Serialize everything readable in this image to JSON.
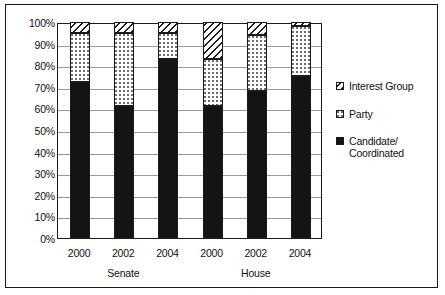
{
  "chart_data": {
    "type": "bar",
    "subtype": "stacked-100-percent",
    "title": "",
    "xlabel": "",
    "ylabel": "",
    "ylim": [
      0,
      100
    ],
    "y_tick_labels": [
      "100%",
      "90%",
      "80%",
      "70%",
      "60%",
      "50%",
      "40%",
      "30%",
      "20%",
      "10%",
      "0%"
    ],
    "y_tick_values": [
      100,
      90,
      80,
      70,
      60,
      50,
      40,
      30,
      20,
      10,
      0
    ],
    "grid": true,
    "legend_position": "right",
    "categories": [
      "2000",
      "2002",
      "2004",
      "2000",
      "2002",
      "2004"
    ],
    "groups": [
      {
        "name": "Senate",
        "categories": [
          "2000",
          "2002",
          "2004"
        ]
      },
      {
        "name": "House",
        "categories": [
          "2000",
          "2002",
          "2004"
        ]
      }
    ],
    "series": [
      {
        "name": "Candidate/\nCoordinated",
        "pattern": "solid-black",
        "values": [
          72,
          61,
          83,
          61,
          68,
          75
        ]
      },
      {
        "name": "Party",
        "pattern": "dotted",
        "values": [
          23,
          34,
          12,
          22,
          26,
          23
        ]
      },
      {
        "name": "Interest Group",
        "pattern": "diagonal-hatch",
        "values": [
          5,
          5,
          5,
          17,
          6,
          2
        ]
      }
    ]
  },
  "legend": {
    "items": [
      {
        "label": "Interest Group",
        "swatch": "diagonal-hatch-icon"
      },
      {
        "label": "Party",
        "swatch": "dotted-icon"
      },
      {
        "label": "Candidate/\nCoordinated",
        "swatch": "solid-black-icon"
      }
    ]
  },
  "axis": {
    "x_group_labels": [
      "Senate",
      "House"
    ]
  },
  "colors": {
    "ink": "#1a1a1a",
    "grid": "#9a9a9a",
    "paper": "#ffffff",
    "candidate_fill": "#141414",
    "party_dot": "#6b6b6b"
  }
}
